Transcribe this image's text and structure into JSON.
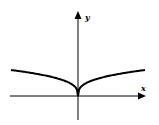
{
  "chart_data": {
    "type": "line",
    "title": "",
    "xlabel": "x",
    "ylabel": "y",
    "grid": false,
    "legend": null,
    "axes": {
      "x_arrow": true,
      "y_arrow": true,
      "ticks": []
    },
    "series": [
      {
        "name": "curve",
        "x": [
          -1.0,
          -0.8,
          -0.6,
          -0.4,
          -0.2,
          -0.1,
          -0.03,
          0,
          0.03,
          0.1,
          0.2,
          0.4,
          0.6,
          0.8,
          1.0
        ],
        "y": [
          1.0,
          0.928,
          0.843,
          0.737,
          0.585,
          0.464,
          0.311,
          0,
          0.311,
          0.464,
          0.585,
          0.737,
          0.843,
          0.928,
          1.0
        ]
      }
    ]
  },
  "labels": {
    "x_axis": "x",
    "y_axis": "y"
  },
  "colors": {
    "stroke": "#000000",
    "background": "#ffffff"
  }
}
